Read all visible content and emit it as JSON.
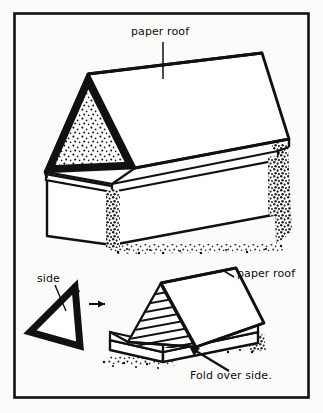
{
  "figure": {
    "border_color": "#111111",
    "ink_color": "#0d0d0d",
    "paper_color": "#fbfbfa",
    "fill_color": "#ffffff"
  },
  "labels": {
    "paper_roof_top": "paper roof",
    "paper_roof_bottom": "paper roof",
    "side": "side",
    "fold_over_side": "Fold over side."
  },
  "annotations": {
    "leader_line_top": "leader-line",
    "leader_line_side": "leader-line",
    "arrow_transform": "arrow-right",
    "arrow_fold": "arrow-pointing-to-fold"
  },
  "drawings": {
    "top_illustration": "box-with-paper-roof-gable-stippled",
    "bottom_illustration": "box-with-paper-roof-hatched-gable",
    "side_piece": "triangle-side-piece"
  }
}
